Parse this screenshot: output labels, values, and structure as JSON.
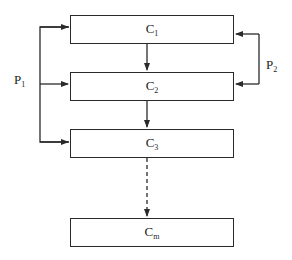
{
  "diagram": {
    "type": "flow",
    "boxes": [
      {
        "id": "c1",
        "main": "C",
        "sub": "1"
      },
      {
        "id": "c2",
        "main": "C",
        "sub": "2"
      },
      {
        "id": "c3",
        "main": "C",
        "sub": "3"
      },
      {
        "id": "cm",
        "main": "C",
        "sub": "m"
      }
    ],
    "paths": [
      {
        "id": "p1",
        "main": "P",
        "sub": "1",
        "targets": [
          "c1",
          "c2",
          "c3"
        ],
        "side": "left"
      },
      {
        "id": "p2",
        "main": "P",
        "sub": "2",
        "targets": [
          "c1",
          "c2"
        ],
        "side": "right"
      }
    ],
    "edges": [
      {
        "from": "c1",
        "to": "c2",
        "style": "solid"
      },
      {
        "from": "c2",
        "to": "c3",
        "style": "solid"
      },
      {
        "from": "c3",
        "to": "cm",
        "style": "dashed"
      }
    ],
    "colors": {
      "line": "#2a2a2a",
      "text": "#1e1e1e",
      "background": "#ffffff"
    }
  }
}
